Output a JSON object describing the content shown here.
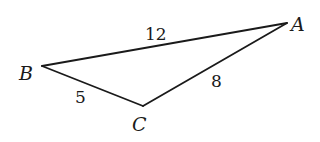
{
  "figure": {
    "type": "triangle",
    "vertices": [
      {
        "id": "A",
        "label": "A",
        "x": 287,
        "y": 23
      },
      {
        "id": "B",
        "label": "B",
        "x": 42,
        "y": 66
      },
      {
        "id": "C",
        "label": "C",
        "x": 143,
        "y": 106
      }
    ],
    "edges": [
      {
        "from": "B",
        "to": "A",
        "label": "12"
      },
      {
        "from": "A",
        "to": "C",
        "label": "8"
      },
      {
        "from": "B",
        "to": "C",
        "label": "5"
      }
    ],
    "colors": {
      "stroke": "#1a1a1a",
      "background": "#ffffff"
    }
  }
}
